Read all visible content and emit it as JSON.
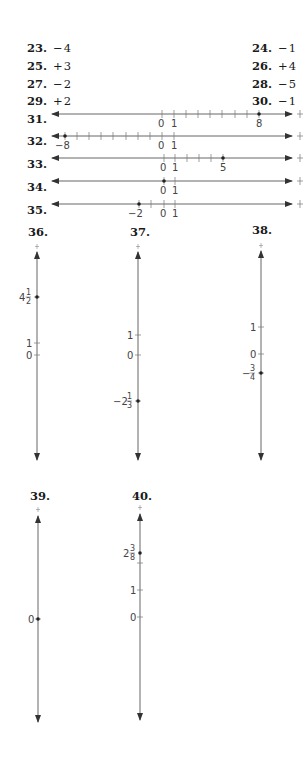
{
  "answers": [
    {
      "number": "23.",
      "value": "−4"
    },
    {
      "number": "24.",
      "value": "−1"
    },
    {
      "number": "25.",
      "value": "+3"
    },
    {
      "number": "26.",
      "value": "+4"
    },
    {
      "number": "27.",
      "value": "−2"
    },
    {
      "number": "28.",
      "value": "−5"
    },
    {
      "number": "29.",
      "value": "+2"
    },
    {
      "number": "30.",
      "value": "−1"
    }
  ],
  "horizontal_lines": [
    {
      "number": "31.",
      "labels": [
        "0",
        "1",
        "8"
      ],
      "point": "8"
    },
    {
      "number": "32.",
      "labels": [
        "−8",
        "0",
        "1"
      ],
      "point": "−8"
    },
    {
      "number": "33.",
      "labels": [
        "0",
        "1",
        "5"
      ],
      "point": "5"
    },
    {
      "number": "34.",
      "labels": [
        "0",
        "1"
      ],
      "point": "0"
    },
    {
      "number": "35.",
      "labels": [
        "−2",
        "0",
        "1"
      ],
      "point": "−2"
    }
  ],
  "vertical_lines": [
    {
      "number": "36.",
      "labels": [
        "1",
        "0"
      ],
      "point_whole": "4",
      "point_num": "1",
      "point_den": "2"
    },
    {
      "number": "37.",
      "labels": [
        "1",
        "0"
      ],
      "point_whole": "−2",
      "point_num": "1",
      "point_den": "3"
    },
    {
      "number": "38.",
      "labels": [
        "1",
        "0"
      ],
      "point_whole": "−",
      "point_num": "3",
      "point_den": "4"
    },
    {
      "number": "39.",
      "labels": [
        "0"
      ],
      "point": "0"
    },
    {
      "number": "40.",
      "labels": [
        "1",
        "0"
      ],
      "point_whole": "2",
      "point_num": "3",
      "point_den": "8"
    }
  ],
  "colors": {
    "ink": "#1a1a1a",
    "line": "#555555"
  }
}
